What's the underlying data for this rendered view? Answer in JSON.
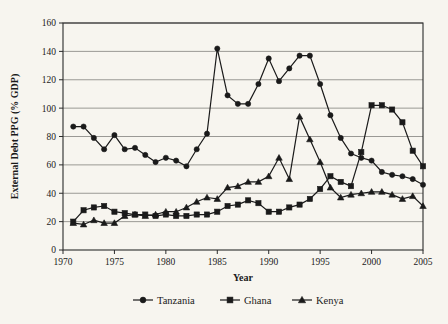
{
  "chart_data": {
    "type": "line",
    "title": "",
    "xlabel": "Year",
    "ylabel": "External Debt PPG (% GDP)",
    "xlim": [
      1970,
      2005
    ],
    "ylim": [
      0,
      160
    ],
    "xticks": [
      1970,
      1975,
      1980,
      1985,
      1990,
      1995,
      2000,
      2005
    ],
    "yticks": [
      0,
      20,
      40,
      60,
      80,
      100,
      120,
      140,
      160
    ],
    "grid": "horizontal",
    "legend_position": "bottom",
    "x": [
      1971,
      1972,
      1973,
      1974,
      1975,
      1976,
      1977,
      1978,
      1979,
      1980,
      1981,
      1982,
      1983,
      1984,
      1985,
      1986,
      1987,
      1988,
      1989,
      1990,
      1991,
      1992,
      1993,
      1994,
      1995,
      1996,
      1997,
      1998,
      1999,
      2000,
      2001,
      2002,
      2003,
      2004,
      2005
    ],
    "series": [
      {
        "name": "Tanzania",
        "marker": "circle",
        "values": [
          87,
          87,
          79,
          71,
          81,
          71,
          72,
          67,
          62,
          65,
          63,
          59,
          71,
          82,
          142,
          109,
          103,
          103,
          117,
          135,
          119,
          128,
          137,
          137,
          117,
          95,
          79,
          68,
          65,
          63,
          55,
          53,
          52,
          50,
          46
        ]
      },
      {
        "name": "Ghana",
        "marker": "square",
        "values": [
          20,
          28,
          30,
          31,
          27,
          26,
          25,
          25,
          24,
          25,
          24,
          24,
          25,
          25,
          27,
          31,
          32,
          35,
          33,
          27,
          27,
          30,
          32,
          36,
          43,
          52,
          48,
          45,
          46,
          47,
          47,
          49,
          47,
          45,
          44
        ]
      },
      {
        "name": "Kenya",
        "marker": "triangle",
        "values": [
          19,
          18,
          21,
          19,
          19,
          24,
          25,
          24,
          25,
          27,
          27,
          30,
          34,
          37,
          36,
          44,
          45,
          48,
          48,
          52,
          65,
          50,
          94,
          78,
          62,
          44,
          37,
          39,
          40,
          41,
          41,
          39,
          36,
          38,
          31
        ]
      }
    ],
    "ghana_override_note": "",
    "ghana_values_right": [
      69,
      102,
      102,
      99,
      90,
      70,
      59
    ]
  },
  "legend": {
    "items": [
      {
        "label": "Tanzania",
        "marker": "circle"
      },
      {
        "label": "Ghana",
        "marker": "square"
      },
      {
        "label": "Kenya",
        "marker": "triangle"
      }
    ]
  },
  "colors": {
    "background": "#f7f5ef",
    "ink": "#1a1a1a",
    "gridline": "#8f8f8a"
  }
}
